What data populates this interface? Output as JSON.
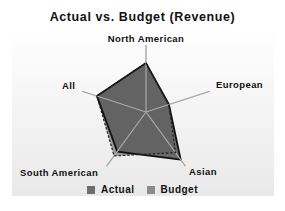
{
  "chart_data": {
    "type": "radar",
    "title": "Actual vs. Budget (Revenue)",
    "categories": [
      "North American",
      "European",
      "Asian",
      "South American",
      "All"
    ],
    "series": [
      {
        "name": "Actual",
        "values": [
          73,
          36,
          88,
          73,
          77
        ],
        "color": "#5a5a5a",
        "line": "solid"
      },
      {
        "name": "Budget",
        "values": [
          73,
          36,
          75,
          81,
          77
        ],
        "color": "#8a8a8a",
        "line": "dashed"
      }
    ],
    "value_unit": "percent of axis max (estimated, no scale shown)",
    "rlim": [
      0,
      100
    ],
    "grid": false,
    "legend_position": "bottom"
  },
  "legend": {
    "items": [
      {
        "label": "Actual",
        "color": "#6e6e6e"
      },
      {
        "label": "Budget",
        "color": "#8c8c8c"
      }
    ]
  }
}
